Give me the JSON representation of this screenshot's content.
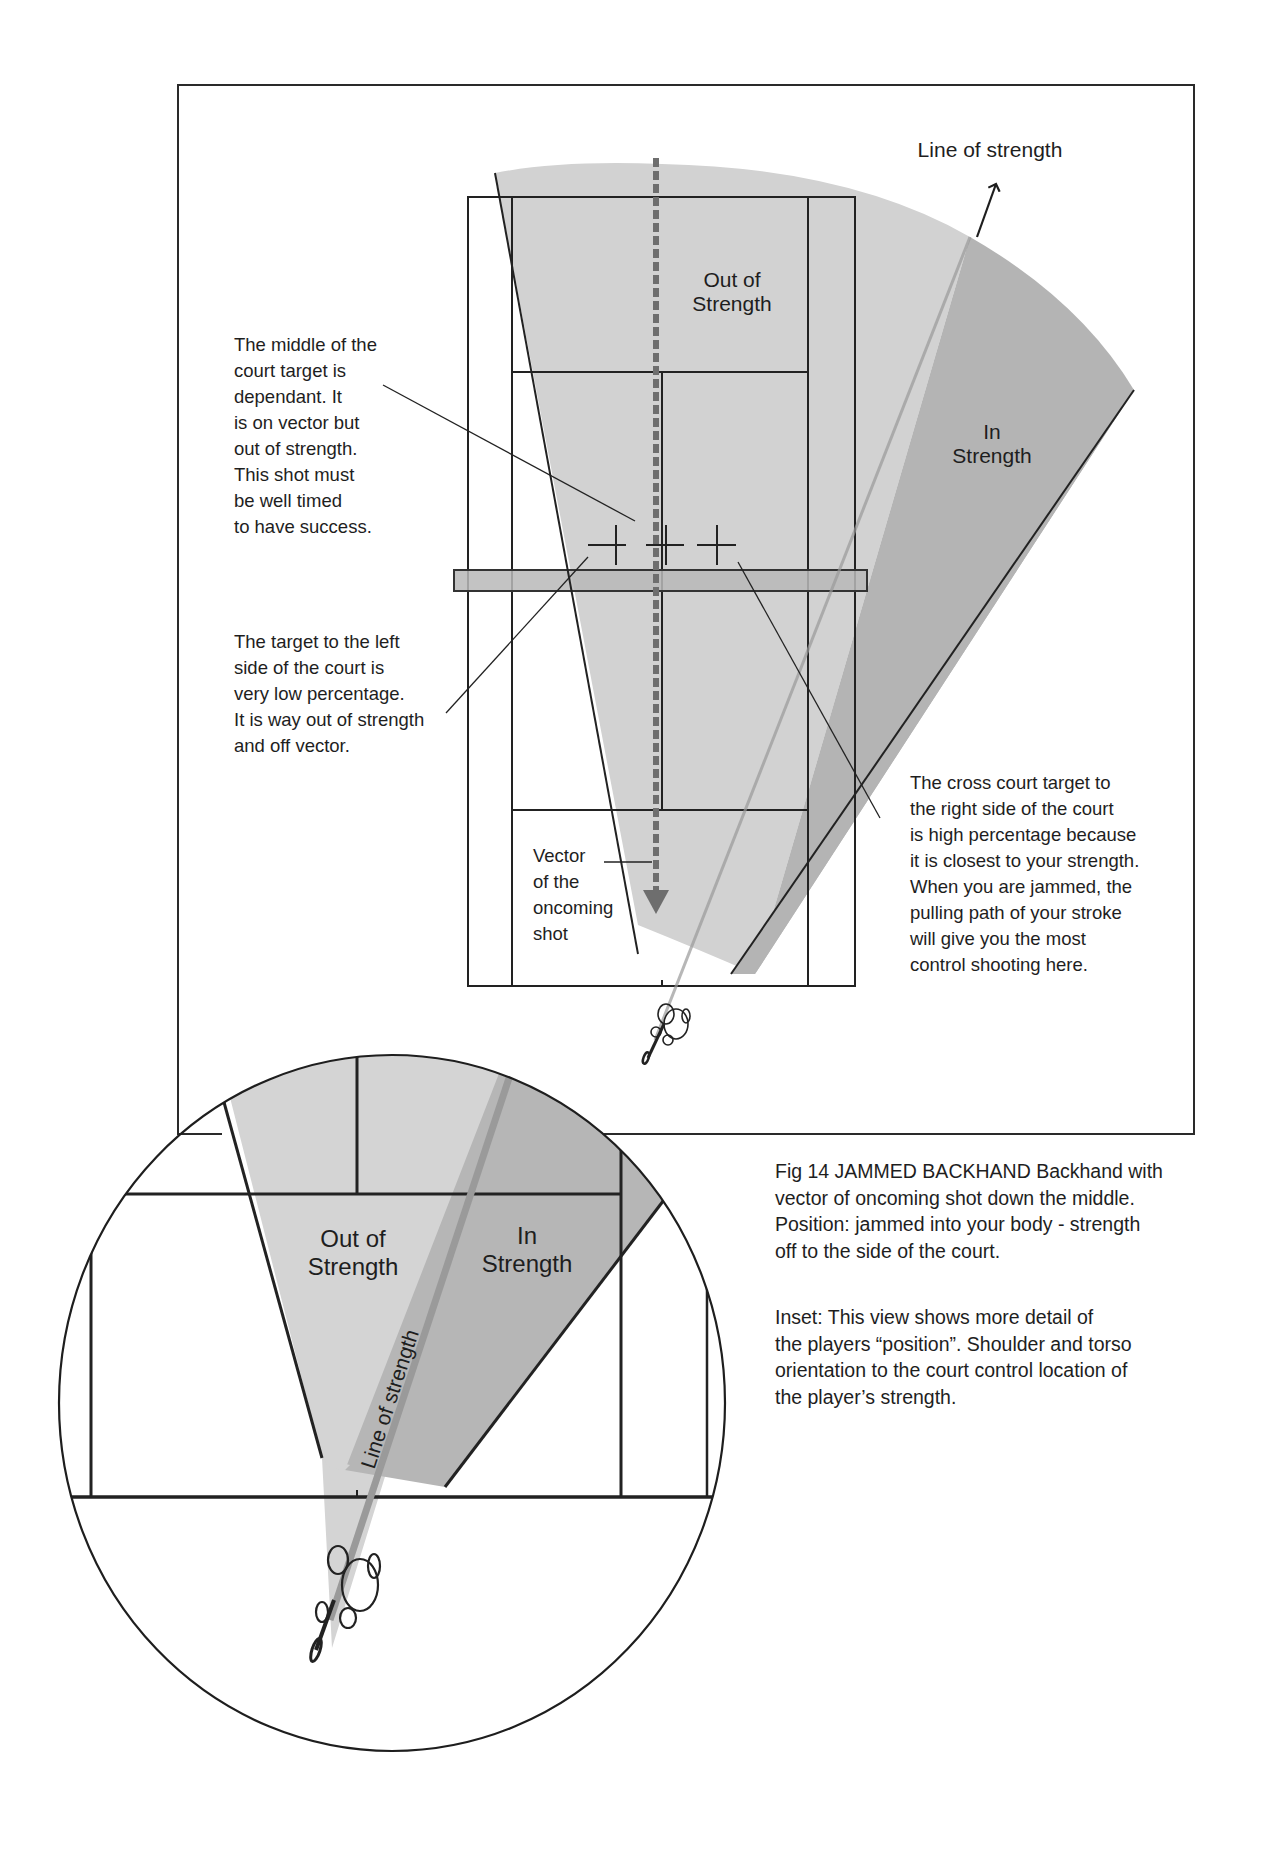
{
  "main_diagram": {
    "top_label": "Line of strength",
    "zone_out": "Out of\nStrength",
    "zone_in": "In\nStrength",
    "vector_label": "Vector\nof the\noncoming\nshot",
    "annotation_middle": "The middle of the\ncourt target is\ndependant. It\nis on vector but\nout of  strength.\nThis shot must\nbe well timed\nto have success.",
    "annotation_left": "The target to the left\nside of the court is\nvery low percentage.\nIt is way out of strength\nand off vector.",
    "annotation_right": "The cross court target to\nthe right side of the court\nis high percentage because\nit is closest to your strength.\nWhen you are jammed, the\npulling path of your stroke\nwill give you the most\ncontrol shooting here.",
    "targets": [
      "left-target",
      "middle-target",
      "cross-court-target"
    ]
  },
  "inset": {
    "zone_out": "Out of\nStrength",
    "zone_in": "In\nStrength",
    "line_label": "Line of strength"
  },
  "caption": {
    "figure": "Fig 14  JAMMED BACKHAND Backhand with\nvector of oncoming shot down the middle.\nPosition: jammed into your body - strength\noff to the side of the court.",
    "inset_note": "Inset:  This view shows more detail of\nthe players “position”. Shoulder and torso\norientation to the court control location of\nthe player’s strength."
  },
  "colors": {
    "out_of_strength_fill": "#d2d2d2",
    "in_strength_fill": "#b4b4b4",
    "line_of_strength": "#9a9a9a",
    "vector_dashes": "#6e6e6e",
    "net_fill": "#b9b9b9",
    "ink": "#1e1e1e"
  }
}
